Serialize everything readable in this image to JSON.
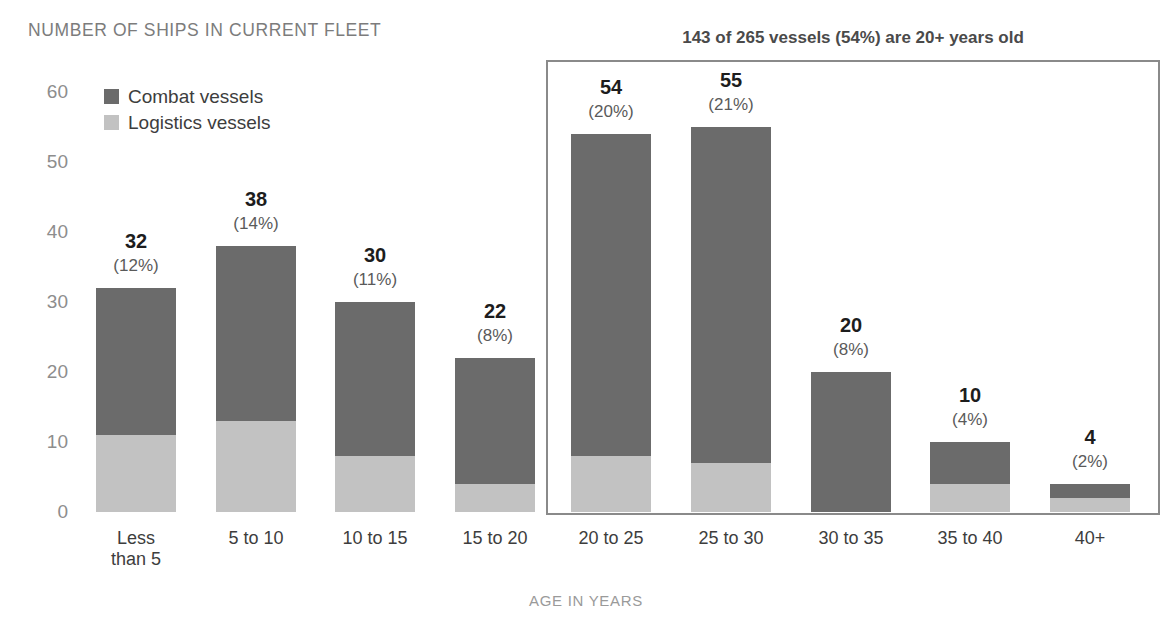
{
  "header": {
    "chart_title": "NUMBER OF SHIPS IN CURRENT FLEET",
    "callout_title": "143 of 265 vessels (54%) are 20+ years old",
    "axis_title": "AGE IN YEARS"
  },
  "legend": {
    "items": [
      {
        "label": "Combat vessels",
        "color": "#6b6b6b",
        "key": "combat"
      },
      {
        "label": "Logistics vessels",
        "color": "#c2c2c2",
        "key": "logistics"
      }
    ]
  },
  "colors": {
    "combat": "#6b6b6b",
    "logistics": "#c2c2c2",
    "box_border": "#8a8a8a",
    "title_gray": "#7c7c7c",
    "tick_gray": "#8d8d8d"
  },
  "chart_data": {
    "type": "bar",
    "subtype": "stacked",
    "title": "NUMBER OF SHIPS IN CURRENT FLEET",
    "annotation": "143 of 265 vessels (54%) are 20+ years old",
    "xlabel": "AGE IN YEARS",
    "ylabel": "",
    "ylim": [
      0,
      60
    ],
    "yticks": [
      0,
      10,
      20,
      30,
      40,
      50,
      60
    ],
    "grid": false,
    "legend_position": "top-left",
    "categories": [
      "Less\nthan 5",
      "5 to 10",
      "10 to 15",
      "15 to 20",
      "20 to 25",
      "25 to 30",
      "30 to 35",
      "35 to 40",
      "40+"
    ],
    "category_labels": [
      [
        "Less",
        "than 5"
      ],
      [
        "5 to 10"
      ],
      [
        "10 to 15"
      ],
      [
        "15 to 20"
      ],
      [
        "20 to 25"
      ],
      [
        "25 to 30"
      ],
      [
        "30 to 35"
      ],
      [
        "35 to 40"
      ],
      [
        "40+"
      ]
    ],
    "series": [
      {
        "name": "Combat vessels",
        "values": [
          21,
          25,
          22,
          18,
          46,
          48,
          20,
          6,
          2
        ]
      },
      {
        "name": "Logistics vessels",
        "values": [
          11,
          13,
          8,
          4,
          8,
          7,
          0,
          4,
          2
        ]
      }
    ],
    "totals": [
      32,
      38,
      30,
      22,
      54,
      55,
      20,
      10,
      4
    ],
    "percents": [
      "(12%)",
      "(14%)",
      "(11%)",
      "(8%)",
      "(20%)",
      "(21%)",
      "(8%)",
      "(4%)",
      "(2%)"
    ],
    "total_vessels": 265,
    "aged_vessels": 143,
    "aged_percent": "54%"
  },
  "bars": [
    {
      "label_lines": [
        "Less",
        "than 5"
      ],
      "total": "32",
      "pct": "(12%)",
      "combat": 21,
      "logistics": 11,
      "x": 96,
      "w": 80,
      "in_box": false
    },
    {
      "label_lines": [
        "5 to 10"
      ],
      "total": "38",
      "pct": "(14%)",
      "combat": 25,
      "logistics": 13,
      "x": 216,
      "w": 80,
      "in_box": false
    },
    {
      "label_lines": [
        "10 to 15"
      ],
      "total": "30",
      "pct": "(11%)",
      "combat": 22,
      "logistics": 8,
      "x": 335,
      "w": 80,
      "in_box": false
    },
    {
      "label_lines": [
        "15 to 20"
      ],
      "total": "22",
      "pct": "(8%)",
      "combat": 18,
      "logistics": 4,
      "x": 455,
      "w": 80,
      "in_box": false
    },
    {
      "label_lines": [
        "20 to 25"
      ],
      "total": "54",
      "pct": "(20%)",
      "combat": 46,
      "logistics": 8,
      "x": 571,
      "w": 80,
      "in_box": true
    },
    {
      "label_lines": [
        "25 to 30"
      ],
      "total": "55",
      "pct": "(21%)",
      "combat": 48,
      "logistics": 7,
      "x": 691,
      "w": 80,
      "in_box": true
    },
    {
      "label_lines": [
        "30 to 35"
      ],
      "total": "20",
      "pct": "(8%)",
      "combat": 20,
      "logistics": 0,
      "x": 811,
      "w": 80,
      "in_box": true
    },
    {
      "label_lines": [
        "35 to 40"
      ],
      "total": "10",
      "pct": "(4%)",
      "combat": 6,
      "logistics": 4,
      "x": 930,
      "w": 80,
      "in_box": true
    },
    {
      "label_lines": [
        "40+"
      ],
      "total": "4",
      "pct": "(2%)",
      "combat": 2,
      "logistics": 2,
      "x": 1050,
      "w": 80,
      "in_box": true
    }
  ],
  "yaxis": {
    "ticks": [
      "60",
      "50",
      "40",
      "30",
      "20",
      "10",
      "0"
    ],
    "values": [
      60,
      50,
      40,
      30,
      20,
      10,
      0
    ]
  }
}
